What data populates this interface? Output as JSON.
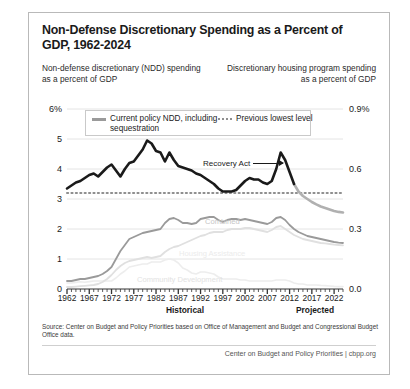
{
  "title": "Non-Defense Discretionary Spending as a Percent of GDP, 1962-2024",
  "subtitle_left": "Non-defense discretionary (NDD) spending as a percent of GDP",
  "subtitle_right": "Discretionary housing program spending as a percent of GDP",
  "legend": {
    "item_solid": "Current policy NDD, including sequestration",
    "item_dotted": "Previous lowest level"
  },
  "annotations": {
    "recovery_act": "Recovery Act",
    "combined": "Combined",
    "housing_assistance": "Housing Assistance",
    "community_development": "Community Development"
  },
  "era": {
    "historical": "Historical",
    "projected": "Projected"
  },
  "source": "Source: Center on Budget and Policy Priorities based on Office of Management and Budget and Congressional Budget Office data.",
  "credit": "Center on Budget and Policy Priorities | cbpp.org",
  "colors": {
    "ndd_historical": "#1a1a1a",
    "ndd_projected": "#b0b0b0",
    "previous_lowest": "#8f8f8f",
    "combined": "#9a9a9a",
    "housing_assistance": "#e0e0e0",
    "community_development": "#ededed",
    "gridline": "#dddddd",
    "border": "#b9b9b9"
  },
  "chart_data": {
    "type": "line",
    "title": "Non-Defense Discretionary Spending as a Percent of GDP, 1962-2024",
    "xlabel": "",
    "ylabel": "Non-defense discretionary (NDD) spending as a percent of GDP",
    "ylabel_right": "Discretionary housing program spending as a percent of GDP",
    "xlim": [
      1962,
      2024
    ],
    "ylim": [
      0,
      6
    ],
    "ylim_right": [
      0,
      0.9
    ],
    "yticks": [
      "0",
      "1",
      "2",
      "3",
      "4",
      "5",
      "6%"
    ],
    "yticks_right": [
      "0.0",
      "0.3",
      "0.6",
      "0.9%"
    ],
    "xticks": [
      1962,
      1967,
      1972,
      1977,
      1982,
      1987,
      1992,
      1997,
      2002,
      2007,
      2012,
      2017,
      2022
    ],
    "grid": true,
    "legend_position": "top-center",
    "historical_end": 2013,
    "previous_lowest_level": 3.2,
    "x": [
      1962,
      1963,
      1964,
      1965,
      1966,
      1967,
      1968,
      1969,
      1970,
      1971,
      1972,
      1973,
      1974,
      1975,
      1976,
      1977,
      1978,
      1979,
      1980,
      1981,
      1982,
      1983,
      1984,
      1985,
      1986,
      1987,
      1988,
      1989,
      1990,
      1991,
      1992,
      1993,
      1994,
      1995,
      1996,
      1997,
      1998,
      1999,
      2000,
      2001,
      2002,
      2003,
      2004,
      2005,
      2006,
      2007,
      2008,
      2009,
      2010,
      2011,
      2012,
      2013,
      2014,
      2015,
      2016,
      2017,
      2018,
      2019,
      2020,
      2021,
      2022,
      2023,
      2024
    ],
    "series": [
      {
        "name": "Current policy NDD, including sequestration",
        "axis": "left",
        "values": [
          3.35,
          3.45,
          3.55,
          3.6,
          3.7,
          3.8,
          3.85,
          3.75,
          3.9,
          4.05,
          4.15,
          3.95,
          3.75,
          4.0,
          4.2,
          4.25,
          4.45,
          4.65,
          4.95,
          4.85,
          4.6,
          4.55,
          4.25,
          4.55,
          4.3,
          4.1,
          4.05,
          4.0,
          3.95,
          3.85,
          3.8,
          3.7,
          3.6,
          3.5,
          3.35,
          3.25,
          3.25,
          3.25,
          3.3,
          3.45,
          3.6,
          3.7,
          3.65,
          3.65,
          3.55,
          3.5,
          3.6,
          4.0,
          4.55,
          4.3,
          3.9,
          3.5,
          3.25,
          3.1,
          3.0,
          2.9,
          2.82,
          2.75,
          2.7,
          2.65,
          2.6,
          2.57,
          2.55
        ]
      },
      {
        "name": "Previous lowest level",
        "axis": "left",
        "style": "dotted",
        "values": [
          3.2,
          3.2,
          3.2,
          3.2,
          3.2,
          3.2,
          3.2,
          3.2,
          3.2,
          3.2,
          3.2,
          3.2,
          3.2,
          3.2,
          3.2,
          3.2,
          3.2,
          3.2,
          3.2,
          3.2,
          3.2,
          3.2,
          3.2,
          3.2,
          3.2,
          3.2,
          3.2,
          3.2,
          3.2,
          3.2,
          3.2,
          3.2,
          3.2,
          3.2,
          3.2,
          3.2,
          3.2,
          3.2,
          3.2,
          3.2,
          3.2,
          3.2,
          3.2,
          3.2,
          3.2,
          3.2,
          3.2,
          3.2,
          3.2,
          3.2,
          3.2,
          3.2,
          3.2,
          3.2,
          3.2,
          3.2,
          3.2,
          3.2,
          3.2,
          3.2,
          3.2,
          3.2,
          3.2
        ]
      },
      {
        "name": "Combined",
        "axis": "right",
        "values": [
          0.04,
          0.04,
          0.045,
          0.05,
          0.05,
          0.055,
          0.06,
          0.065,
          0.075,
          0.09,
          0.11,
          0.15,
          0.19,
          0.22,
          0.25,
          0.26,
          0.27,
          0.28,
          0.285,
          0.29,
          0.295,
          0.3,
          0.33,
          0.35,
          0.355,
          0.345,
          0.33,
          0.33,
          0.325,
          0.33,
          0.35,
          0.355,
          0.36,
          0.36,
          0.345,
          0.335,
          0.345,
          0.35,
          0.35,
          0.345,
          0.35,
          0.345,
          0.34,
          0.335,
          0.33,
          0.325,
          0.335,
          0.355,
          0.36,
          0.345,
          0.32,
          0.3,
          0.285,
          0.275,
          0.265,
          0.26,
          0.255,
          0.25,
          0.245,
          0.24,
          0.235,
          0.232,
          0.23
        ]
      },
      {
        "name": "Housing Assistance",
        "axis": "right",
        "values": [
          0.01,
          0.01,
          0.012,
          0.014,
          0.016,
          0.018,
          0.02,
          0.025,
          0.035,
          0.05,
          0.07,
          0.095,
          0.115,
          0.13,
          0.14,
          0.145,
          0.15,
          0.155,
          0.16,
          0.155,
          0.16,
          0.165,
          0.185,
          0.2,
          0.21,
          0.215,
          0.225,
          0.235,
          0.245,
          0.255,
          0.265,
          0.27,
          0.28,
          0.285,
          0.285,
          0.285,
          0.295,
          0.3,
          0.3,
          0.3,
          0.305,
          0.305,
          0.3,
          0.295,
          0.29,
          0.285,
          0.295,
          0.31,
          0.315,
          0.3,
          0.285,
          0.27,
          0.26,
          0.25,
          0.245,
          0.24,
          0.235,
          0.23,
          0.228,
          0.225,
          0.222,
          0.22,
          0.218
        ]
      },
      {
        "name": "Community Development",
        "axis": "right",
        "values": [
          0.03,
          0.03,
          0.033,
          0.036,
          0.034,
          0.037,
          0.04,
          0.04,
          0.04,
          0.04,
          0.04,
          0.055,
          0.075,
          0.09,
          0.11,
          0.115,
          0.12,
          0.125,
          0.125,
          0.135,
          0.135,
          0.135,
          0.145,
          0.15,
          0.145,
          0.13,
          0.105,
          0.095,
          0.08,
          0.075,
          0.085,
          0.085,
          0.08,
          0.075,
          0.06,
          0.05,
          0.05,
          0.05,
          0.05,
          0.045,
          0.045,
          0.04,
          0.04,
          0.04,
          0.04,
          0.04,
          0.04,
          0.045,
          0.045,
          0.045,
          0.04,
          0.03,
          0.025,
          0.025,
          0.02,
          0.02,
          0.02,
          0.018,
          0.017,
          0.015,
          0.013,
          0.012,
          0.012
        ]
      }
    ]
  }
}
